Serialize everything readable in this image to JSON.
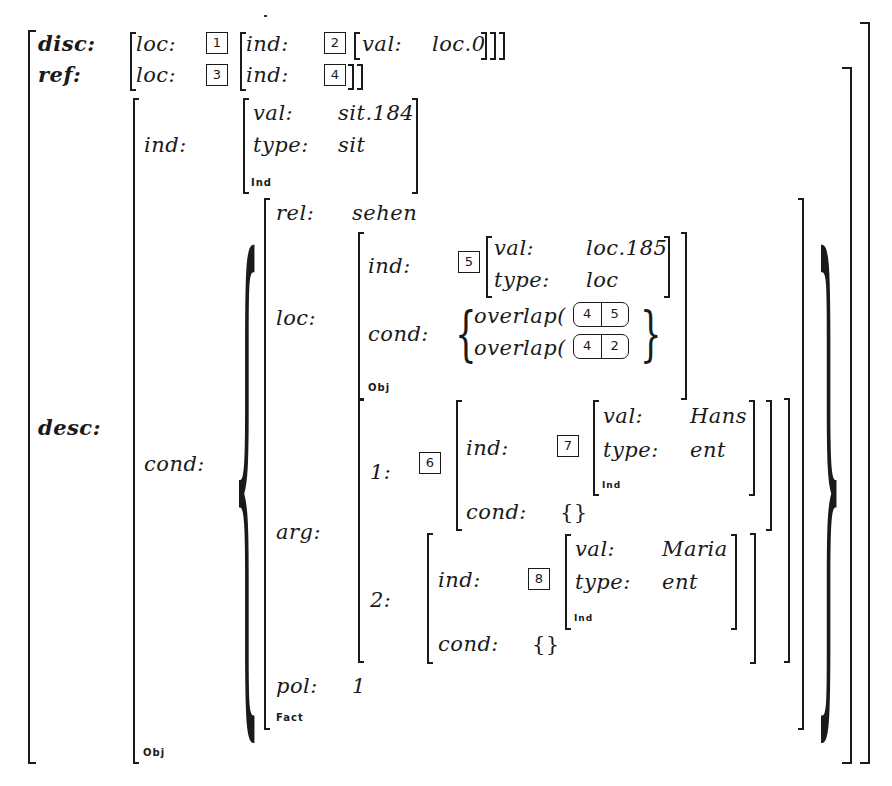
{
  "avm": {
    "disc": {
      "label": "disc:",
      "loc_label": "loc:",
      "loc_tag": "1",
      "ind_label": "ind:",
      "ind_tag": "2",
      "val_label": "val:",
      "val_value": "loc.0",
      "closing": "]]]"
    },
    "ref": {
      "label": "ref:",
      "loc_label": "loc:",
      "loc_tag": "3",
      "ind_label": "ind:",
      "ind_tag": "4"
    },
    "desc": {
      "label": "desc:",
      "sort": "Obj",
      "ind": {
        "label": "ind:",
        "val_label": "val:",
        "val_value": "sit.184",
        "type_label": "type:",
        "type_value": "sit",
        "sort": "Ind"
      },
      "cond": {
        "label": "cond:",
        "sort": "Fact",
        "rel_label": "rel:",
        "rel_value": "sehen",
        "loc": {
          "label": "loc:",
          "sort": "Obj",
          "ind_label": "ind:",
          "ind_tag": "5",
          "val_label": "val:",
          "val_value": "loc.185",
          "type_label": "type:",
          "type_value": "loc",
          "cond_label": "cond:",
          "overlaps": [
            {
              "fn": "overlap(",
              "args": [
                "4",
                "5"
              ],
              "close": ")"
            },
            {
              "fn": "overlap(",
              "args": [
                "4",
                "2"
              ],
              "close": ")"
            }
          ]
        },
        "arg": {
          "label": "arg:",
          "items": [
            {
              "label": "1:",
              "tag": "6",
              "ind_label": "ind:",
              "ind_tag": "7",
              "val_label": "val:",
              "val_value": "Hans",
              "type_label": "type:",
              "type_value": "ent",
              "sort": "Ind",
              "cond_label": "cond:",
              "cond_value": "{}"
            },
            {
              "label": "2:",
              "ind_label": "ind:",
              "ind_tag": "8",
              "val_label": "val:",
              "val_value": "Maria",
              "type_label": "type:",
              "type_value": "ent",
              "sort": "Ind",
              "cond_label": "cond:",
              "cond_value": "{}"
            }
          ]
        },
        "pol_label": "pol:",
        "pol_value": "1"
      }
    }
  },
  "glyphs": {
    "lbrace": "{",
    "rbrace": "}"
  }
}
